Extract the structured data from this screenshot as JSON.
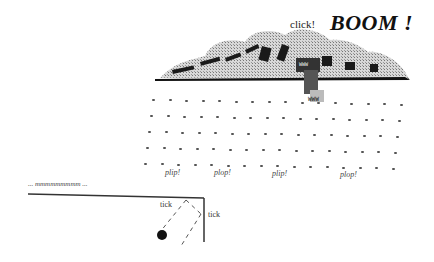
{
  "labels": {
    "click": "click!",
    "boom": "BOOM !",
    "sign_top": "WWW",
    "sign_bottom": "WWW",
    "drips": [
      "plip!",
      "plop!",
      "plip!",
      "plop!"
    ],
    "hum": "... mmmmmmmmm ...",
    "tick_left": "tick",
    "tick_right": "tick"
  },
  "scene": {
    "cloud_color": "#9a9a9a",
    "ink_color": "#111111",
    "rain_rows": 5,
    "rain_cols": 16
  }
}
